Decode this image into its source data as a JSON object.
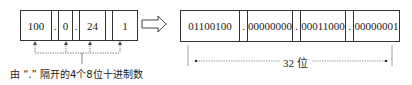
{
  "decimal": {
    "cells": [
      "100",
      ".",
      "0",
      ".",
      "24",
      "",
      "1"
    ],
    "caption": "由 “.” 隔开的4个8位十进制数"
  },
  "binary": {
    "cells": [
      "01100100",
      ".",
      "00000000",
      ".",
      "00011000",
      ".",
      "00000001"
    ],
    "width_label": "32 位"
  },
  "arrow": "⟹"
}
